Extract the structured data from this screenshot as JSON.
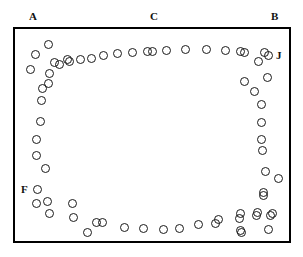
{
  "figure": {
    "width": 303,
    "height": 257,
    "background_color": "#ffffff",
    "marker_color": "#1a1a1a",
    "border_color": "#000000"
  },
  "plot_border": {
    "x": 13,
    "y": 27,
    "width": 278,
    "height": 216,
    "stroke_width": 2
  },
  "labels": [
    {
      "name": "label-A",
      "text": "A",
      "x": 29,
      "y": 11
    },
    {
      "name": "label-C",
      "text": "C",
      "x": 150,
      "y": 11
    },
    {
      "name": "label-B",
      "text": "B",
      "x": 271,
      "y": 11
    },
    {
      "name": "label-J",
      "text": "J",
      "x": 276,
      "y": 50
    },
    {
      "name": "label-F",
      "text": "F",
      "x": 21,
      "y": 184
    }
  ],
  "chart_data": {
    "type": "scatter",
    "title": "",
    "xlabel": "",
    "ylabel": "",
    "xlim": [
      13,
      291
    ],
    "ylim": [
      27,
      243
    ],
    "grid": false,
    "legend": "none",
    "annotations": [
      "A",
      "C",
      "B",
      "J",
      "F"
    ],
    "marker_style": "open-circle",
    "marker_diameter": 9,
    "point_count": 76,
    "points": [
      [
        48,
        44
      ],
      [
        35,
        54
      ],
      [
        54,
        62
      ],
      [
        67,
        59
      ],
      [
        30,
        69
      ],
      [
        49,
        73
      ],
      [
        59,
        64
      ],
      [
        69,
        61
      ],
      [
        80,
        59
      ],
      [
        91,
        58
      ],
      [
        103,
        55
      ],
      [
        117,
        53
      ],
      [
        132,
        52
      ],
      [
        147,
        51
      ],
      [
        152,
        51
      ],
      [
        166,
        50
      ],
      [
        185,
        49
      ],
      [
        206,
        49
      ],
      [
        225,
        50
      ],
      [
        240,
        51
      ],
      [
        244,
        52
      ],
      [
        258,
        61
      ],
      [
        268,
        55
      ],
      [
        264,
        52
      ],
      [
        267,
        77
      ],
      [
        244,
        81
      ],
      [
        254,
        91
      ],
      [
        261,
        104
      ],
      [
        261,
        122
      ],
      [
        261,
        139
      ],
      [
        262,
        150
      ],
      [
        265,
        171
      ],
      [
        278,
        178
      ],
      [
        263,
        192
      ],
      [
        263,
        195
      ],
      [
        257,
        212
      ],
      [
        272,
        213
      ],
      [
        268,
        229
      ],
      [
        256,
        215
      ],
      [
        270,
        215
      ],
      [
        240,
        213
      ],
      [
        240,
        230
      ],
      [
        239,
        218
      ],
      [
        241,
        232
      ],
      [
        218,
        219
      ],
      [
        215,
        223
      ],
      [
        198,
        224
      ],
      [
        179,
        228
      ],
      [
        163,
        229
      ],
      [
        143,
        228
      ],
      [
        124,
        227
      ],
      [
        102,
        222
      ],
      [
        87,
        232
      ],
      [
        96,
        222
      ],
      [
        73,
        217
      ],
      [
        72,
        203
      ],
      [
        49,
        213
      ],
      [
        47,
        201
      ],
      [
        36,
        203
      ],
      [
        37,
        189
      ],
      [
        45,
        168
      ],
      [
        36,
        155
      ],
      [
        36,
        139
      ],
      [
        40,
        121
      ],
      [
        41,
        100
      ],
      [
        48,
        83
      ],
      [
        42,
        88
      ]
    ]
  }
}
